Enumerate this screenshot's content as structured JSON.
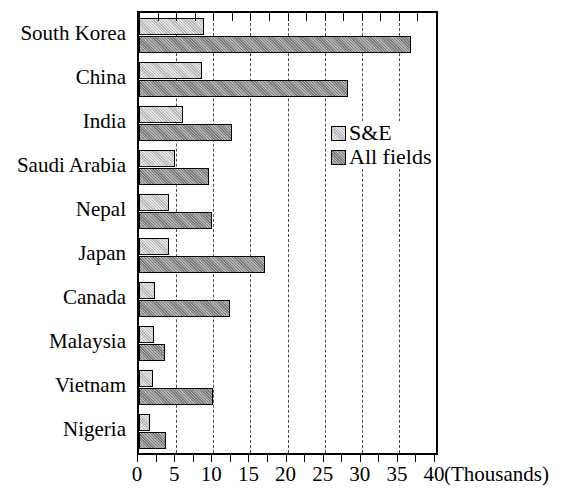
{
  "chart_data": {
    "type": "bar",
    "orientation": "horizontal",
    "title": "",
    "xlabel": "(Thousands)",
    "ylabel": "",
    "xlim": [
      0,
      40
    ],
    "xticks": [
      0,
      5,
      10,
      15,
      20,
      25,
      30,
      35,
      40
    ],
    "xtick_labels": [
      "0",
      "5",
      "10",
      "15",
      "20",
      "25",
      "30",
      "35",
      "40"
    ],
    "minor_tick_step": 2.5,
    "grid": true,
    "grid_axis": "x",
    "grid_style": "dash-dot",
    "legend_position": "inside-right-upper",
    "categories": [
      "South Korea",
      "China",
      "India",
      "Saudi Arabia",
      "Nepal",
      "Japan",
      "Canada",
      "Malaysia",
      "Vietnam",
      "Nigeria"
    ],
    "series": [
      {
        "name": "S&E",
        "color": "#c9c9c9",
        "values": [
          8.8,
          8.5,
          5.9,
          4.8,
          4.0,
          4.0,
          2.2,
          2.0,
          1.9,
          1.5
        ]
      },
      {
        "name": "All fields",
        "color": "#949494",
        "values": [
          36.6,
          28.1,
          12.5,
          9.4,
          9.8,
          17.0,
          12.3,
          3.5,
          9.9,
          3.7
        ]
      }
    ]
  },
  "legend": {
    "items": [
      {
        "label": "S&E",
        "swatch": "se"
      },
      {
        "label": "All fields",
        "swatch": "all"
      }
    ]
  },
  "axis": {
    "units_label": "(Thousands)"
  }
}
